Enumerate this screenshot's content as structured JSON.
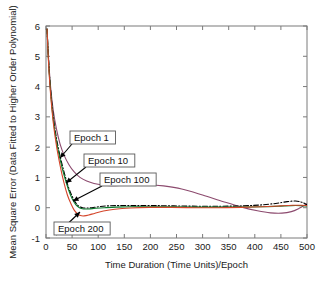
{
  "chart_data": {
    "type": "line",
    "title": "",
    "xlabel": "Time Duration (Time Units)/Epoch",
    "ylabel": "Mean Square Error (Data Fitted to Higher Order Polynomial)",
    "xlim": [
      0,
      500
    ],
    "ylim": [
      -1,
      6
    ],
    "xticks": [
      0,
      50,
      100,
      150,
      200,
      250,
      300,
      350,
      400,
      450,
      500
    ],
    "yticks": [
      -1,
      0,
      1,
      2,
      3,
      4,
      5,
      6
    ],
    "xtick_labels": [
      "0",
      "50",
      "100",
      "150",
      "200",
      "250",
      "300",
      "350",
      "400",
      "450",
      "500"
    ],
    "ytick_labels": [
      "-1",
      "0",
      "1",
      "2",
      "3",
      "4",
      "5",
      "6"
    ],
    "grid": false,
    "legend_position": "none",
    "annotations": [
      {
        "label": "Epoch 1",
        "box_x": 70,
        "box_y": 131,
        "arrow_to_x": 60,
        "arrow_to_y": 158
      },
      {
        "label": "Epoch 10",
        "box_x": 84,
        "box_y": 154,
        "arrow_to_x": 66,
        "arrow_to_y": 183
      },
      {
        "label": "Epoch 100",
        "box_x": 100,
        "box_y": 173,
        "arrow_to_x": 73,
        "arrow_to_y": 201
      },
      {
        "label": "Epoch 200",
        "box_x": 54,
        "box_y": 222,
        "arrow_to_x": 80,
        "arrow_to_y": 212
      }
    ],
    "series": [
      {
        "name": "Epoch 1",
        "color": "#8c4a6e",
        "style": "solid",
        "width": 1.1,
        "x": [
          2,
          5,
          9,
          14,
          20,
          27,
          35,
          44,
          54,
          65,
          78,
          92,
          108,
          125,
          145,
          168,
          195,
          225,
          260,
          300,
          340,
          375,
          405,
          430,
          452,
          470,
          485,
          497,
          500
        ],
        "y": [
          5.9,
          4.9,
          3.95,
          3.2,
          2.6,
          2.1,
          1.72,
          1.42,
          1.18,
          1.0,
          0.88,
          0.8,
          0.75,
          0.73,
          0.74,
          0.76,
          0.76,
          0.72,
          0.62,
          0.42,
          0.2,
          0.02,
          -0.1,
          -0.17,
          -0.18,
          -0.13,
          -0.02,
          0.1,
          0.13
        ]
      },
      {
        "name": "Epoch 10",
        "color": "#000000",
        "style": "dashdot",
        "width": 1.1,
        "x": [
          2,
          5,
          9,
          14,
          20,
          27,
          35,
          43,
          50,
          57,
          63,
          70,
          78,
          88,
          100,
          118,
          140,
          170,
          205,
          245,
          290,
          335,
          375,
          410,
          440,
          462,
          478,
          490,
          500
        ],
        "y": [
          5.9,
          4.85,
          3.85,
          3.0,
          2.3,
          1.7,
          1.15,
          0.68,
          0.38,
          0.16,
          0.05,
          0.0,
          -0.01,
          0.0,
          0.03,
          0.06,
          0.07,
          0.07,
          0.07,
          0.06,
          0.05,
          0.05,
          0.06,
          0.09,
          0.14,
          0.2,
          0.22,
          0.18,
          0.1
        ]
      },
      {
        "name": "Epoch 100",
        "color": "#0a7a2a",
        "style": "solid",
        "width": 1.1,
        "x": [
          2,
          5,
          9,
          14,
          20,
          27,
          35,
          43,
          50,
          57,
          64,
          72,
          82,
          95,
          112,
          135,
          165,
          200,
          240,
          285,
          330,
          375,
          415,
          445,
          470,
          488,
          500
        ],
        "y": [
          5.9,
          4.8,
          3.78,
          2.9,
          2.2,
          1.6,
          1.05,
          0.6,
          0.3,
          0.1,
          0.0,
          -0.04,
          -0.04,
          -0.02,
          0.0,
          0.02,
          0.03,
          0.03,
          0.03,
          0.02,
          0.02,
          0.02,
          0.03,
          0.05,
          0.07,
          0.07,
          0.06
        ]
      },
      {
        "name": "Epoch 200",
        "color": "#d4452a",
        "style": "solid",
        "width": 1.1,
        "x": [
          2,
          5,
          9,
          14,
          20,
          27,
          34,
          41,
          48,
          54,
          60,
          66,
          73,
          82,
          94,
          110,
          132,
          162,
          198,
          240,
          285,
          330,
          375,
          415,
          448,
          472,
          488,
          500
        ],
        "y": [
          5.9,
          4.75,
          3.7,
          2.8,
          2.05,
          1.4,
          0.85,
          0.42,
          0.12,
          -0.08,
          -0.2,
          -0.26,
          -0.27,
          -0.24,
          -0.18,
          -0.11,
          -0.05,
          -0.01,
          0.01,
          0.01,
          0.0,
          0.0,
          0.01,
          0.03,
          0.06,
          0.08,
          0.08,
          0.07
        ]
      }
    ]
  }
}
